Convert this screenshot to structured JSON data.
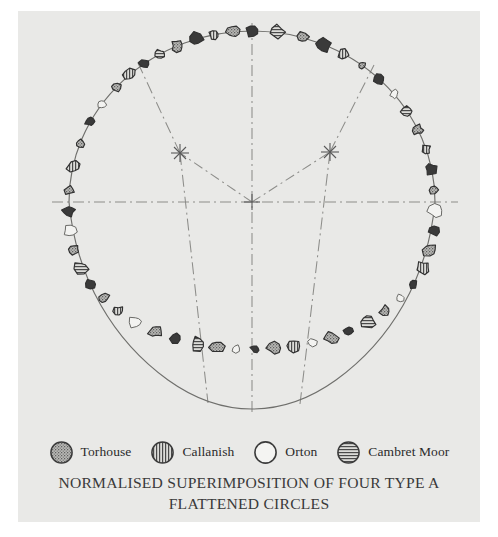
{
  "figure": {
    "background_color": "#e9e9e7",
    "page_color": "#ffffff"
  },
  "caption": {
    "line1": "NORMALISED SUPERIMPOSITION OF FOUR TYPE A",
    "line2": "FLATTENED CIRCLES"
  },
  "legend": {
    "items": [
      {
        "label": "Torhouse",
        "pattern": "stipple",
        "swatch_name": "legend-swatch-torhouse"
      },
      {
        "label": "Callanish",
        "pattern": "vertical",
        "swatch_name": "legend-swatch-callanish"
      },
      {
        "label": "Orton",
        "pattern": "open",
        "swatch_name": "legend-swatch-orton"
      },
      {
        "label": "Cambret Moor",
        "pattern": "horizontal",
        "swatch_name": "legend-swatch-cambret-moor"
      }
    ]
  },
  "chart_data": {
    "type": "scatter",
    "title": "NORMALISED SUPERIMPOSITION OF FOUR TYPE A FLATTENED CIRCLES",
    "xlabel": "",
    "ylabel": "",
    "grid": false,
    "legend_position": "bottom",
    "ink_color": "#3c3c3c",
    "construction": {
      "center": {
        "x": 234,
        "y": 191,
        "name": "primary-centre"
      },
      "secondary_centres": [
        {
          "x": 162,
          "y": 142,
          "name": "left-secondary-centre"
        },
        {
          "x": 312,
          "y": 141,
          "name": "right-secondary-centre"
        }
      ],
      "horizontal_axis": {
        "x1": 34,
        "y1": 191,
        "x2": 440,
        "y2": 191
      },
      "vertical_axis": {
        "x1": 234,
        "y1": 12,
        "x2": 234,
        "y2": 404
      },
      "radial_lines": [
        {
          "x1": 234,
          "y1": 191,
          "x2": 162,
          "y2": 142
        },
        {
          "x1": 234,
          "y1": 191,
          "x2": 312,
          "y2": 141
        },
        {
          "x1": 162,
          "y1": 142,
          "x2": 188,
          "y2": 390
        },
        {
          "x1": 312,
          "y1": 141,
          "x2": 284,
          "y2": 391
        },
        {
          "x1": 162,
          "y1": 142,
          "x2": 124,
          "y2": 60
        },
        {
          "x1": 312,
          "y1": 141,
          "x2": 352,
          "y2": 61
        }
      ]
    },
    "ring": {
      "type": "type-a-flattened-circle",
      "radius_x": 183,
      "radius_y": 171,
      "flattened_arc": "bottom",
      "flattening_factor": 0.86
    },
    "stones": [
      {
        "angle": 90,
        "pattern": "solid"
      },
      {
        "angle": 96,
        "pattern": "stipple"
      },
      {
        "angle": 102,
        "pattern": "vertical"
      },
      {
        "angle": 108,
        "pattern": "solid"
      },
      {
        "angle": 114,
        "pattern": "stipple"
      },
      {
        "angle": 120,
        "pattern": "horizontal"
      },
      {
        "angle": 126,
        "pattern": "solid"
      },
      {
        "angle": 132,
        "pattern": "vertical"
      },
      {
        "angle": 138,
        "pattern": "stipple"
      },
      {
        "angle": 145,
        "pattern": "open"
      },
      {
        "angle": 152,
        "pattern": "solid"
      },
      {
        "angle": 160,
        "pattern": "stipple"
      },
      {
        "angle": 168,
        "pattern": "vertical"
      },
      {
        "angle": 176,
        "pattern": "stipple"
      },
      {
        "angle": 183,
        "pattern": "solid"
      },
      {
        "angle": 190,
        "pattern": "open"
      },
      {
        "angle": 197,
        "pattern": "stipple"
      },
      {
        "angle": 204,
        "pattern": "horizontal"
      },
      {
        "angle": 211,
        "pattern": "solid"
      },
      {
        "angle": 218,
        "pattern": "stipple"
      },
      {
        "angle": 225,
        "pattern": "vertical"
      },
      {
        "angle": 232,
        "pattern": "open"
      },
      {
        "angle": 239,
        "pattern": "stipple"
      },
      {
        "angle": 246,
        "pattern": "solid"
      },
      {
        "angle": 253,
        "pattern": "horizontal"
      },
      {
        "angle": 259,
        "pattern": "stipple"
      },
      {
        "angle": 265,
        "pattern": "open"
      },
      {
        "angle": 271,
        "pattern": "solid"
      },
      {
        "angle": 277,
        "pattern": "stipple"
      },
      {
        "angle": 283,
        "pattern": "vertical"
      },
      {
        "angle": 289,
        "pattern": "open"
      },
      {
        "angle": 295,
        "pattern": "stipple"
      },
      {
        "angle": 301,
        "pattern": "solid"
      },
      {
        "angle": 308,
        "pattern": "horizontal"
      },
      {
        "angle": 315,
        "pattern": "stipple"
      },
      {
        "angle": 322,
        "pattern": "open"
      },
      {
        "angle": 329,
        "pattern": "solid"
      },
      {
        "angle": 336,
        "pattern": "vertical"
      },
      {
        "angle": 343,
        "pattern": "stipple"
      },
      {
        "angle": 350,
        "pattern": "solid"
      },
      {
        "angle": 357,
        "pattern": "open"
      },
      {
        "angle": 4,
        "pattern": "stipple"
      },
      {
        "angle": 11,
        "pattern": "solid"
      },
      {
        "angle": 18,
        "pattern": "vertical"
      },
      {
        "angle": 25,
        "pattern": "stipple"
      },
      {
        "angle": 32,
        "pattern": "horizontal"
      },
      {
        "angle": 39,
        "pattern": "open"
      },
      {
        "angle": 46,
        "pattern": "solid"
      },
      {
        "angle": 53,
        "pattern": "stipple"
      },
      {
        "angle": 60,
        "pattern": "vertical"
      },
      {
        "angle": 67,
        "pattern": "solid"
      },
      {
        "angle": 74,
        "pattern": "stipple"
      },
      {
        "angle": 82,
        "pattern": "horizontal"
      }
    ]
  }
}
